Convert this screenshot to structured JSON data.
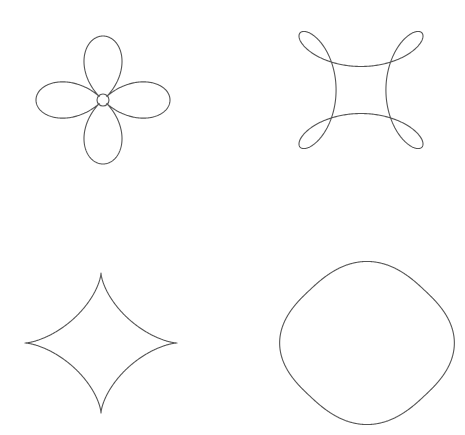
{
  "canvas": {
    "width": 465,
    "height": 435,
    "background": "#ffffff",
    "stroke_color": "#555555"
  },
  "figures": [
    {
      "id": "four-petal-flower",
      "position": "top-left",
      "type": "rose-with-center-loop",
      "center": [
        103,
        100
      ],
      "half_width": 67,
      "half_height": 64,
      "center_loop_radius": 6
    },
    {
      "id": "four-loop-knot",
      "position": "top-right",
      "type": "four-loop-curve",
      "center": [
        361,
        90
      ],
      "half_width": 72,
      "half_height": 68
    },
    {
      "id": "astroid",
      "position": "bottom-left",
      "type": "astroid",
      "center": [
        101,
        343
      ],
      "half_width": 76,
      "half_height": 70
    },
    {
      "id": "squircle",
      "position": "bottom-right",
      "type": "superellipse-rotated",
      "center": [
        367,
        343
      ],
      "half_width": 75,
      "half_height": 70
    }
  ]
}
